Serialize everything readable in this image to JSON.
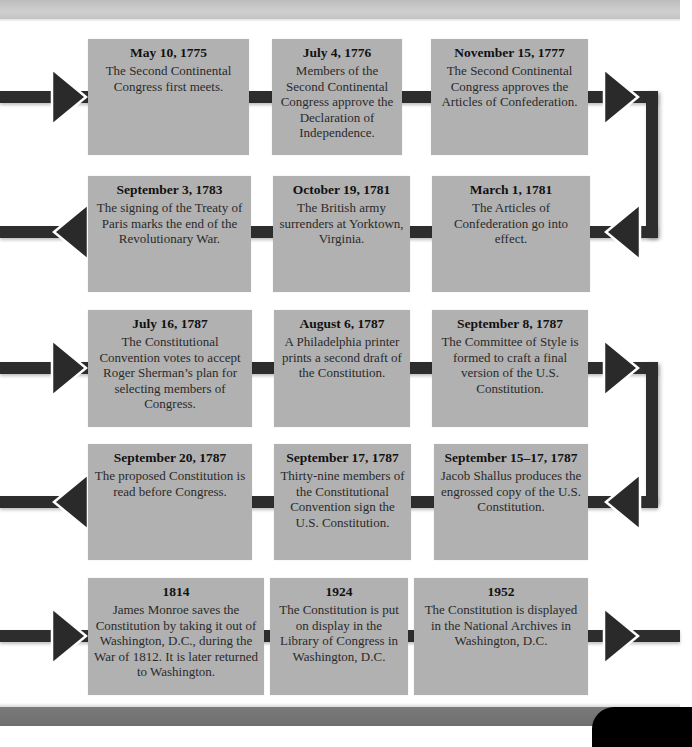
{
  "colors": {
    "box_bg": "#b1b1b1",
    "connector": "#2d2d2d",
    "arrow_outline": "#ffffff",
    "text": "#1f1f1f"
  },
  "rows": [
    {
      "direction": "right",
      "events": [
        {
          "date": "May 10, 1775",
          "description": "The Second Continental Congress first meets."
        },
        {
          "date": "July 4, 1776",
          "description": "Members of the Second Continental Congress approve the Declaration of Independence."
        },
        {
          "date": "November 15, 1777",
          "description": "The Second Continental Congress approves the Articles of Confederation."
        }
      ]
    },
    {
      "direction": "left",
      "events": [
        {
          "date": "September 3, 1783",
          "description": "The signing of the Treaty of Paris marks the end of the Revolutionary War."
        },
        {
          "date": "October 19, 1781",
          "description": "The British army surrenders at Yorktown, Virginia."
        },
        {
          "date": "March 1, 1781",
          "description": "The Articles of Confederation go into effect."
        }
      ]
    },
    {
      "direction": "right",
      "events": [
        {
          "date": "July 16, 1787",
          "description": "The Constitutional Convention votes to accept Roger Sherman’s plan for selecting members of Congress."
        },
        {
          "date": "August 6, 1787",
          "description": "A Philadelphia printer prints a second draft of the Constitution."
        },
        {
          "date": "September 8, 1787",
          "description": "The Committee of Style is formed to craft a final version of the U.S. Constitution."
        }
      ]
    },
    {
      "direction": "left",
      "events": [
        {
          "date": "September 20, 1787",
          "description": "The proposed Constitution is read before Congress."
        },
        {
          "date": "September 17, 1787",
          "description": "Thirty-nine members of the Constitutional Convention sign the U.S. Constitution."
        },
        {
          "date": "September 15–17, 1787",
          "description": "Jacob Shallus produces the engrossed copy of the U.S. Constitution."
        }
      ]
    },
    {
      "direction": "right",
      "events": [
        {
          "date": "1814",
          "description": "James Monroe saves the Constitution by taking it out of Washington, D.C., during the War of 1812. It is later returned to Washington."
        },
        {
          "date": "1924",
          "description": "The Constitution is put on display in the Library of Congress in Washington, D.C."
        },
        {
          "date": "1952",
          "description": "The Constitution is displayed in the National Archives in Washington, D.C."
        }
      ]
    }
  ]
}
